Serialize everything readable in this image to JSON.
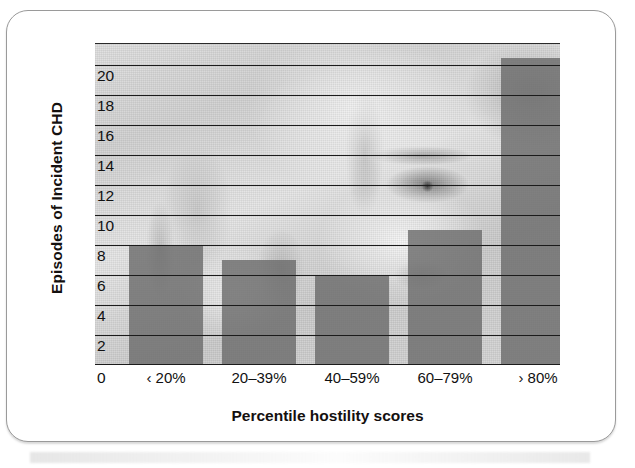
{
  "figure": {
    "background_description": "grayscale photograph of a man's face with a clenched fist"
  },
  "chart_data": {
    "type": "bar",
    "title": "",
    "subtitle": "",
    "xlabel": "Percentile hostility scores",
    "ylabel": "Episodes of Incident CHD",
    "categories": [
      "‹ 20%",
      "20–39%",
      "40–59%",
      "60–79%",
      "› 80%"
    ],
    "values": [
      8,
      7,
      6,
      9,
      20.5
    ],
    "ylim": [
      0,
      21.5
    ],
    "yticks": [
      0,
      2,
      4,
      6,
      8,
      10,
      12,
      14,
      16,
      18,
      20
    ],
    "ytick_labels": [
      "0",
      "2",
      "4",
      "6",
      "8",
      "10",
      "12",
      "14",
      "16",
      "18",
      "20"
    ],
    "grid": "horizontal",
    "legend": "none",
    "bar_color": "#6d6d6d",
    "gridline_color": "#1b1b1b",
    "series": [
      {
        "name": "Episodes of Incident CHD",
        "values": [
          8,
          7,
          6,
          9,
          20.5
        ]
      }
    ]
  }
}
